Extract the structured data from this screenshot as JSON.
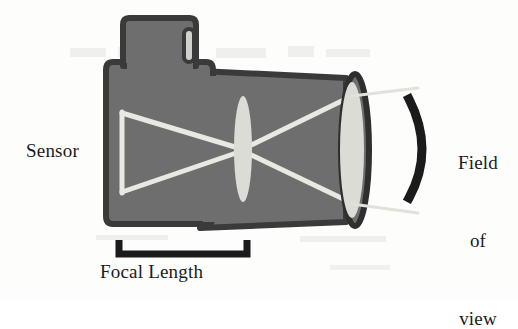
{
  "diagram": {
    "labels": {
      "sensor": "Sensor",
      "focal_length": "Focal Length",
      "field_of_view_line1": "Field",
      "field_of_view_line2": "of",
      "field_of_view_line3": "view"
    },
    "colors": {
      "background": "#fdfdfc",
      "body_fill": "#6e6e6e",
      "body_outline": "#3a3a3a",
      "lens_glass": "#d9d9d4",
      "ray": "#e6e6e0",
      "bracket": "#1b1b1b",
      "text": "#1b1b1b"
    },
    "parts": {
      "camera_body": "camera-body",
      "viewfinder_hump": "viewfinder-hump",
      "shutter_slot": "shutter-button-slot",
      "lens_barrel": "lens-barrel",
      "inner_lens": "inner-lens-element",
      "front_lens": "front-lens-element",
      "sensor_plane": "sensor-plane-line",
      "focal_bracket": "focal-length-bracket",
      "fov_bracket": "field-of-view-bracket"
    },
    "geometry": {
      "sensor_plane_x": 122,
      "sensor_plane_top_y": 113,
      "sensor_plane_bottom_y": 192,
      "inner_lens_center_x": 243,
      "inner_lens_center_y": 149,
      "inner_lens_rx": 9,
      "inner_lens_ry": 53,
      "front_lens_center_x": 355,
      "front_lens_center_y": 150,
      "front_lens_rx": 13,
      "front_lens_ry": 72,
      "focal_bracket_left_x": 118,
      "focal_bracket_right_x": 248,
      "focal_bracket_y": 252
    }
  }
}
